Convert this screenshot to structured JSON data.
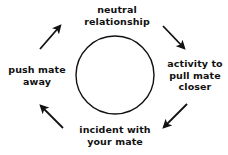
{
  "diagram": {
    "type": "cycle",
    "direction": "clockwise",
    "background_color": "#ffffff",
    "stroke_color": "#111111",
    "center_shape": {
      "name": "circle",
      "cx": 115,
      "cy": 75,
      "r": 39,
      "fill": "none"
    },
    "stages": [
      {
        "id": "neutral",
        "position": "top",
        "label": "neutral\nrelationship"
      },
      {
        "id": "activity",
        "position": "right",
        "label": "activity to\npull mate\ncloser"
      },
      {
        "id": "incident",
        "position": "bottom",
        "label": "incident with\nyour mate"
      },
      {
        "id": "push",
        "position": "left",
        "label": "push mate\naway"
      }
    ],
    "arrows": [
      {
        "id": "neutral-to-activity",
        "position": "top-right",
        "direction": "down-right",
        "from": [
          163,
          26
        ],
        "to": [
          185,
          49
        ]
      },
      {
        "id": "activity-to-incident",
        "position": "bottom-right",
        "direction": "down-left",
        "from": [
          187,
          104
        ],
        "to": [
          163,
          128
        ]
      },
      {
        "id": "incident-to-push",
        "position": "bottom-left",
        "direction": "up-left",
        "from": [
          63,
          128
        ],
        "to": [
          40,
          105
        ]
      },
      {
        "id": "push-to-neutral",
        "position": "top-left",
        "direction": "up-right",
        "from": [
          40,
          49
        ],
        "to": [
          61,
          25
        ]
      }
    ]
  }
}
